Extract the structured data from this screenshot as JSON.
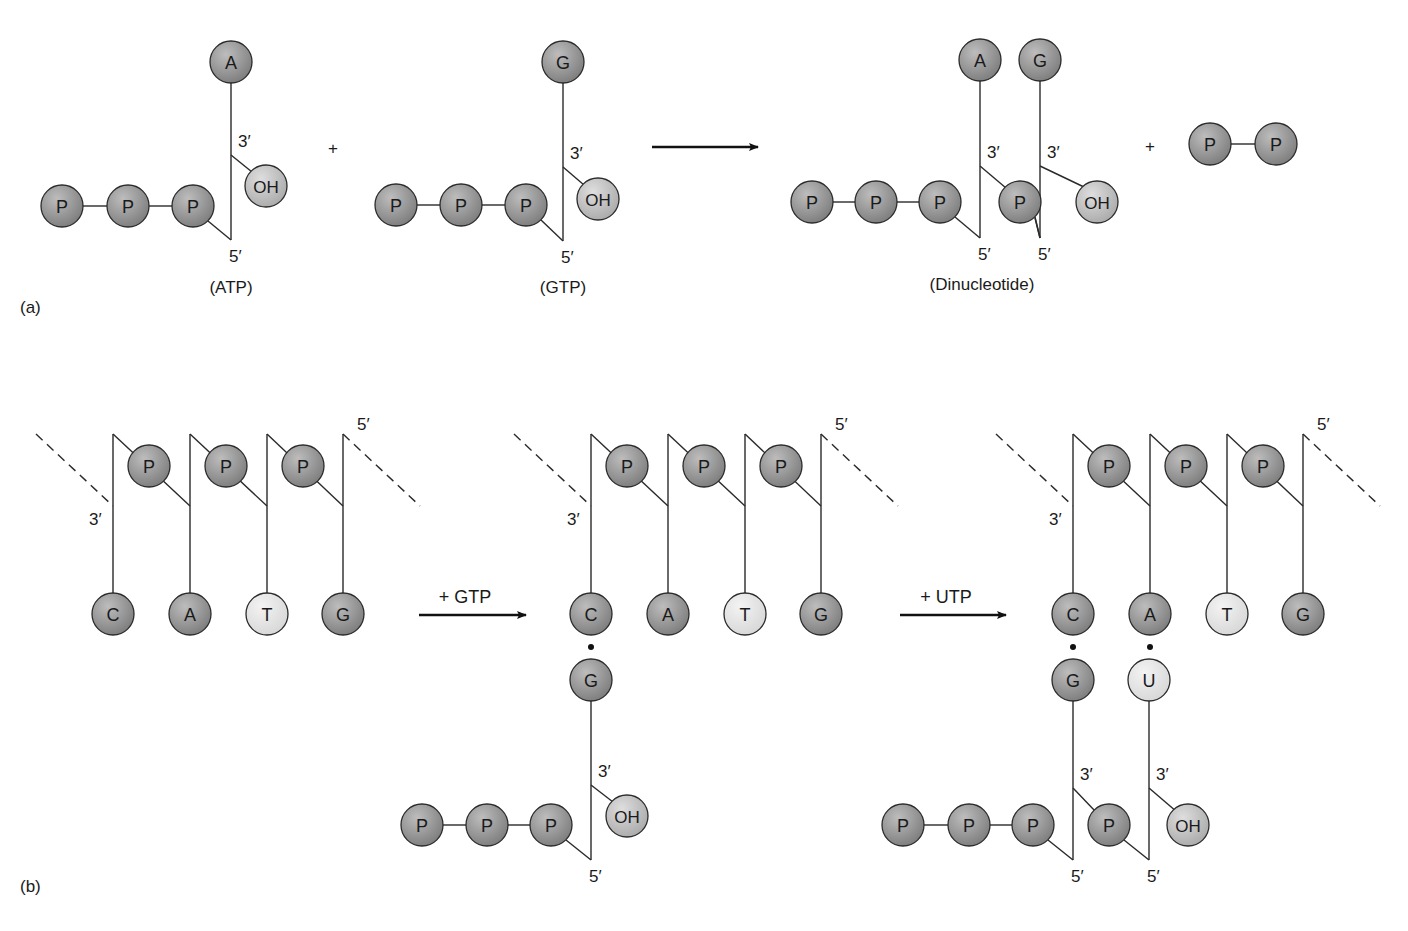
{
  "figure": {
    "colors": {
      "dark_ball": "#7a7a7a",
      "dark_ball_highlight": "#bdbdbd",
      "light_ball": "#d6d6d6",
      "light_ball_highlight": "#f3f3f3",
      "medium_ball": "#a8a8a8",
      "medium_ball_highlight": "#dedede",
      "line": "#2a2a2a"
    },
    "panel_a": {
      "label": "(a)",
      "reactant_1": {
        "base": "A",
        "caption": "(ATP)",
        "phosphates": [
          "P",
          "P",
          "P"
        ],
        "hydroxyl": "OH",
        "three_prime": "3′",
        "five_prime": "5′"
      },
      "plus_1": "+",
      "reactant_2": {
        "base": "G",
        "caption": "(GTP)",
        "phosphates": [
          "P",
          "P",
          "P"
        ],
        "hydroxyl": "OH",
        "three_prime": "3′",
        "five_prime": "5′"
      },
      "product": {
        "caption": "(Dinucleotide)",
        "bases": [
          "A",
          "G"
        ],
        "phosphates": [
          "P",
          "P",
          "P"
        ],
        "linking_phosphate": "P",
        "hydroxyl": "OH",
        "three_prime_labels": [
          "3′",
          "3′"
        ],
        "five_prime_labels": [
          "5′",
          "5′"
        ]
      },
      "plus_2": "+",
      "pyrophosphate": [
        "P",
        "P"
      ]
    },
    "panel_b": {
      "label": "(b)",
      "template_bases": [
        "C",
        "A",
        "T",
        "G"
      ],
      "template_phosphates": [
        "P",
        "P",
        "P"
      ],
      "template_three_prime": "3′",
      "template_five_prime": "5′",
      "step_1": {
        "arrow_label": "+ GTP",
        "new_bases": [
          "G"
        ],
        "phosphates": [
          "P",
          "P",
          "P"
        ],
        "hydroxyl": "OH",
        "three_prime": "3′",
        "five_prime": "5′"
      },
      "step_2": {
        "arrow_label": "+ UTP",
        "new_bases": [
          "G",
          "U"
        ],
        "phosphates": [
          "P",
          "P",
          "P"
        ],
        "linking_phosphate": "P",
        "hydroxyl": "OH",
        "three_prime_labels": [
          "3′",
          "3′"
        ],
        "five_prime_labels": [
          "5′",
          "5′"
        ]
      }
    }
  }
}
